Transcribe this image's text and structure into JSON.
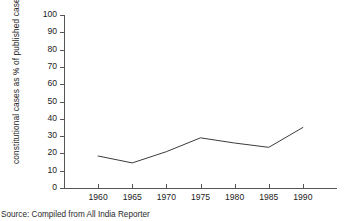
{
  "chart_data": {
    "type": "line",
    "title": "",
    "subtitle": "",
    "xlabel": "",
    "ylabel": "constitutional cases as % of published cases",
    "categories": [
      "1960",
      "1965",
      "1970",
      "1975",
      "1980",
      "1985",
      "1990"
    ],
    "x": [
      1960,
      1965,
      1970,
      1975,
      1980,
      1985,
      1990
    ],
    "values": [
      18.5,
      14.5,
      21.0,
      29.0,
      26.0,
      23.5,
      35.0
    ],
    "series": [
      {
        "name": "constitutional cases as % of published cases",
        "values": [
          18.5,
          14.5,
          21.0,
          29.0,
          26.0,
          23.5,
          35.0
        ]
      }
    ],
    "xlim": [
      1955,
      1995
    ],
    "ylim": [
      0,
      100
    ],
    "ytick_labels": [
      "0",
      "10",
      "20",
      "30",
      "40",
      "50",
      "60",
      "70",
      "80",
      "90",
      "100"
    ],
    "ytick_values": [
      0,
      10,
      20,
      30,
      40,
      50,
      60,
      70,
      80,
      90,
      100
    ],
    "xtick_labels": [
      "1960",
      "1965",
      "1970",
      "1975",
      "1980",
      "1985",
      "1990"
    ],
    "xtick_values": [
      1960,
      1965,
      1970,
      1975,
      1980,
      1985,
      1990
    ],
    "grid": false,
    "legend": false,
    "legend_position": "none",
    "line_color": "#3c3c3c",
    "axis_color": "#555555",
    "markers": false,
    "annotations": []
  },
  "caption": {
    "source_note": "Source: Compiled from All India Reporter"
  }
}
